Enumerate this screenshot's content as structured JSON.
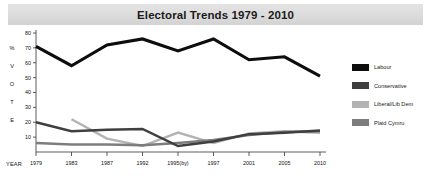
{
  "title": "Electoral Trends 1979 - 2010",
  "axis": {
    "y_caption_letters": [
      "%",
      "V",
      "O",
      "T",
      "E"
    ],
    "x_caption": "YEAR"
  },
  "legend": {
    "items": [
      {
        "label": "Labour",
        "color": "#0d0d0d"
      },
      {
        "label": "Conservative",
        "color": "#3f3f3f"
      },
      {
        "label": "Liberal/Lib Dem",
        "color": "#b3b3b3"
      },
      {
        "label": "Plaid Cymru",
        "color": "#7d7d7d"
      }
    ]
  },
  "chart_data": {
    "type": "line",
    "title": "Electoral Trends 1979 - 2010",
    "xlabel": "YEAR",
    "ylabel": "% VOTE",
    "categories": [
      "1979",
      "1983",
      "1987",
      "1992",
      "1995(by)",
      "1997",
      "2001",
      "2005",
      "2010"
    ],
    "ylim": [
      0,
      80
    ],
    "yticks": [
      10,
      20,
      30,
      40,
      50,
      60,
      70,
      80
    ],
    "grid": false,
    "legend_position": "right",
    "series": [
      {
        "name": "Labour",
        "color": "#0d0d0d",
        "values": [
          71,
          58,
          72,
          76,
          68,
          76,
          62,
          64,
          51
        ]
      },
      {
        "name": "Conservative",
        "color": "#3f3f3f",
        "values": [
          20,
          14,
          15,
          15.5,
          4,
          7,
          12,
          13,
          14.5
        ]
      },
      {
        "name": "Liberal/Lib Dem",
        "color": "#b3b3b3",
        "values": [
          null,
          22,
          9,
          4,
          13,
          6,
          12.5,
          14,
          13
        ]
      },
      {
        "name": "Plaid Cymru",
        "color": "#7d7d7d",
        "values": [
          6,
          5,
          5,
          4.5,
          6,
          8,
          11.5,
          13.5,
          14
        ]
      }
    ]
  }
}
